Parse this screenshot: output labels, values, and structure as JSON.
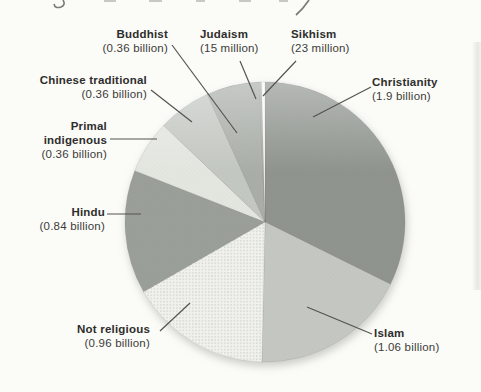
{
  "figure": {
    "background": "#fbfbf8",
    "leader_line_color": "#55544f",
    "text_color": "#3b3b39"
  },
  "chart_data": {
    "type": "pie",
    "direction": "clockwise",
    "start_angle_deg_from_top": 0,
    "order_clockwise_from_top": [
      "Christianity",
      "Islam",
      "Not religious",
      "Hindu",
      "Primal indigenous",
      "Chinese traditional",
      "Buddhist",
      "Judaism",
      "Sikhism"
    ],
    "slices": [
      {
        "label": "Christianity",
        "value_text": "(1.9 billion)",
        "value_billion": 1.9,
        "color": "#8f948e"
      },
      {
        "label": "Islam",
        "value_text": "(1.06 billion)",
        "value_billion": 1.06,
        "color": "#c5c8c2"
      },
      {
        "label": "Not religious",
        "value_text": "(0.96 billion)",
        "value_billion": 0.96,
        "color": "#f2f2ee",
        "texture": "checker-dots"
      },
      {
        "label": "Hindu",
        "value_text": "(0.84 billion)",
        "value_billion": 0.84,
        "color": "#9aa099"
      },
      {
        "label": "Primal indigenous",
        "value_text": "(0.36 billion)",
        "value_billion": 0.36,
        "color": "#e4e6e0"
      },
      {
        "label": "Chinese traditional",
        "value_text": "(0.36 billion)",
        "value_billion": 0.36,
        "color": "#c4c8c2"
      },
      {
        "label": "Buddhist",
        "value_text": "(0.36 billion)",
        "value_billion": 0.36,
        "color": "#a9aea8"
      },
      {
        "label": "Judaism",
        "value_text": "(15 million)",
        "value_billion": 0.015,
        "color": "#b0b5af"
      },
      {
        "label": "Sikhism",
        "value_text": "(23 million)",
        "value_billion": 0.023,
        "color": "#fbfbf8"
      }
    ]
  }
}
